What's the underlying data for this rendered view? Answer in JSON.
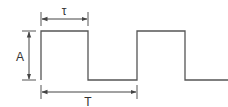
{
  "diagram": {
    "labels": {
      "pulse_width": "τ",
      "amplitude": "A",
      "period": "T"
    },
    "colors": {
      "line": "#555555",
      "text": "#333333",
      "background": "#ffffff"
    },
    "geometry": {
      "high_y": 31,
      "low_y": 80,
      "edges_x": [
        41,
        88,
        137,
        185,
        228
      ]
    }
  }
}
